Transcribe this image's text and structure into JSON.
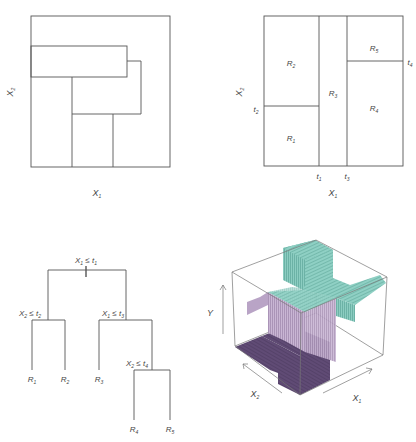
{
  "panels": {
    "top_left": {
      "description": "Non-recursive partition of feature space",
      "x_label": "X",
      "x_label_sub": "1",
      "y_label": "X",
      "y_label_sub": "2"
    },
    "top_right": {
      "description": "Recursive binary splitting partition",
      "x_label": "X",
      "x_label_sub": "1",
      "y_label": "X",
      "y_label_sub": "2",
      "thresholds": {
        "t1": {
          "base": "t",
          "sub": "1"
        },
        "t2": {
          "base": "t",
          "sub": "2"
        },
        "t3": {
          "base": "t",
          "sub": "3"
        },
        "t4": {
          "base": "t",
          "sub": "4"
        }
      },
      "regions": [
        {
          "base": "R",
          "sub": "1"
        },
        {
          "base": "R",
          "sub": "2"
        },
        {
          "base": "R",
          "sub": "3"
        },
        {
          "base": "R",
          "sub": "4"
        },
        {
          "base": "R",
          "sub": "5"
        }
      ]
    },
    "bottom_left": {
      "description": "Decision tree",
      "splits": {
        "root": {
          "var": "X",
          "var_sub": "1",
          "op": " ≤ ",
          "thr": "t",
          "thr_sub": "1"
        },
        "left": {
          "var": "X",
          "var_sub": "2",
          "op": " ≤ ",
          "thr": "t",
          "thr_sub": "2"
        },
        "right": {
          "var": "X",
          "var_sub": "1",
          "op": " ≤ ",
          "thr": "t",
          "thr_sub": "3"
        },
        "right_right": {
          "var": "X",
          "var_sub": "2",
          "op": " ≤ ",
          "thr": "t",
          "thr_sub": "4"
        }
      },
      "leaves": [
        {
          "base": "R",
          "sub": "1"
        },
        {
          "base": "R",
          "sub": "2"
        },
        {
          "base": "R",
          "sub": "3"
        },
        {
          "base": "R",
          "sub": "4"
        },
        {
          "base": "R",
          "sub": "5"
        }
      ]
    },
    "bottom_right": {
      "description": "3D perspective plot of prediction surface",
      "x1_label": "X",
      "x1_label_sub": "1",
      "x2_label": "X",
      "x2_label_sub": "2",
      "y_label": "Y",
      "colors": {
        "floor": "#5e4a72",
        "wall_purple": "#c7b4d2",
        "wall_purple_dark": "#a892b5",
        "top_teal": "#86c9bd",
        "wall_teal": "#6ab5a8",
        "box_line": "#666666"
      }
    }
  }
}
